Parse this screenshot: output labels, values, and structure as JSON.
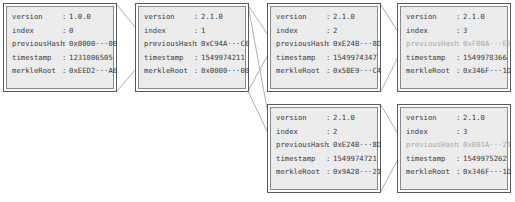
{
  "diagram": {
    "title": "",
    "field_labels": {
      "version": "version",
      "index": "index",
      "previousHash": "previousHash",
      "timestamp": "timestamp",
      "merkleRoot": "merkleRoot"
    },
    "separator": ":",
    "blocks": [
      {
        "id": "block-0",
        "version": "1.0.0",
        "index": "0",
        "previousHash": "0x0000···00",
        "timestamp": "1231006505",
        "merkleRoot": "0xEED2···A6",
        "previousHash_muted": false
      },
      {
        "id": "block-1",
        "version": "2.1.0",
        "index": "1",
        "previousHash": "0xC94A···C6",
        "timestamp": "1549974211",
        "merkleRoot": "0x0000···00",
        "previousHash_muted": false
      },
      {
        "id": "block-2a",
        "version": "2.1.0",
        "index": "2",
        "previousHash": "0xE24B···8D",
        "timestamp": "1549974347",
        "merkleRoot": "0x5BE9···C4",
        "previousHash_muted": false
      },
      {
        "id": "block-3a",
        "version": "2.1.0",
        "index": "3",
        "previousHash": "0xF00A···E7",
        "timestamp": "1549978366",
        "merkleRoot": "0x346F···1D",
        "previousHash_muted": true
      },
      {
        "id": "block-2b",
        "version": "2.1.0",
        "index": "2",
        "previousHash": "0xE24B···8D",
        "timestamp": "1549974721",
        "merkleRoot": "0x9A28···21",
        "previousHash_muted": false
      },
      {
        "id": "block-3b",
        "version": "2.1.0",
        "index": "3",
        "previousHash": "0x801A···21",
        "timestamp": "1549975262",
        "merkleRoot": "0x346F···1D",
        "previousHash_muted": true
      }
    ],
    "links": [
      {
        "from": "block-0",
        "to": "block-1"
      },
      {
        "from": "block-1",
        "to": "block-2a"
      },
      {
        "from": "block-1",
        "to": "block-2b"
      },
      {
        "from": "block-2a",
        "to": "block-3a"
      },
      {
        "from": "block-2b",
        "to": "block-3b"
      }
    ],
    "colors": {
      "block_fill": "#ececec",
      "outer_border": "#5a5a5a",
      "inner_border": "#8a8a8a",
      "text": "#3a3a3a",
      "muted_text": "#a8a8a8",
      "link_line": "#9a9a9a"
    }
  }
}
